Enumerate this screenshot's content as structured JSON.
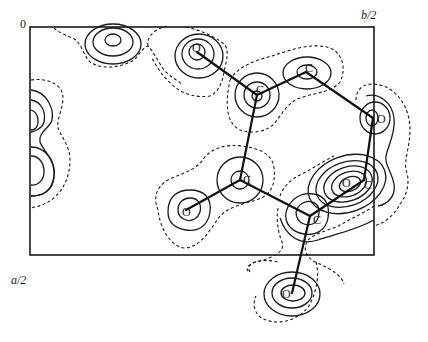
{
  "figure": {
    "axes": {
      "origin_label": "0",
      "b_axis_label": "b/2",
      "a_axis_label": "a/2"
    },
    "legend": {
      "solid": "positive density contours",
      "dashed": "zero / lowest contour"
    },
    "atoms": [
      {
        "id": "O1",
        "label": "O",
        "x": 197,
        "y": 52
      },
      {
        "id": "C1",
        "label": "C",
        "x": 257,
        "y": 95
      },
      {
        "id": "C2",
        "label": "C",
        "x": 308,
        "y": 73
      },
      {
        "id": "O2",
        "label": "O",
        "x": 376,
        "y": 118
      },
      {
        "id": "C3",
        "label": "C",
        "x": 240,
        "y": 180
      },
      {
        "id": "O3",
        "label": "O",
        "x": 187,
        "y": 210
      },
      {
        "id": "C4",
        "label": "C",
        "x": 311,
        "y": 216
      },
      {
        "id": "O4",
        "label": "O",
        "x": 347,
        "y": 186
      },
      {
        "id": "C5",
        "label": "C",
        "x": 366,
        "y": 183
      },
      {
        "id": "O5",
        "label": "O",
        "x": 292,
        "y": 293
      }
    ],
    "bonds": [
      [
        "O1",
        "C1"
      ],
      [
        "C1",
        "C2"
      ],
      [
        "C2",
        "O2"
      ],
      [
        "C1",
        "C3"
      ],
      [
        "C3",
        "O3"
      ],
      [
        "C3",
        "C4"
      ],
      [
        "C4",
        "C5"
      ],
      [
        "O2",
        "C5"
      ],
      [
        "C4",
        "O5"
      ]
    ]
  }
}
